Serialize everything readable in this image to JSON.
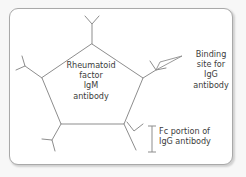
{
  "figure": {
    "type": "biology-schematic",
    "card": {
      "background_color": "#ffffff",
      "border_color": "#a9a9a9",
      "corner_radius": "9px"
    },
    "colors": {
      "stroke": "#8d8d8d",
      "text": "#3c3c3c",
      "page_background": "#f7f7f7"
    }
  },
  "labels": {
    "center": "Rheumatoid\nfactor\nIgM\nantibody",
    "binding_site": "Binding\nsite for\nIgG\nantibody",
    "fc_portion": "Fc portion of\nIgG antibody"
  },
  "structures": {
    "core": {
      "name": "pentagonal-IgM-core",
      "sides": 5
    },
    "arms": [
      {
        "name": "igg-antibody-top",
        "position": "top"
      },
      {
        "name": "igg-antibody-upper-left",
        "position": "upper-left"
      },
      {
        "name": "igg-antibody-upper-right",
        "position": "upper-right"
      },
      {
        "name": "igg-antibody-lower-left",
        "position": "lower-left"
      },
      {
        "name": "igg-antibody-lower-right",
        "position": "lower-right"
      }
    ],
    "annotations": [
      {
        "name": "binding-site-pointer",
        "shape": "elongated-loop-leader"
      },
      {
        "name": "fc-portion-bracket",
        "shape": "vertical-bracket"
      }
    ]
  }
}
